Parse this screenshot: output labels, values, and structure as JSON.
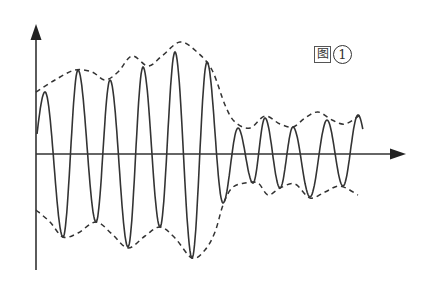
{
  "figure": {
    "label_char": "图",
    "label_number": "1",
    "label_full": "图①",
    "colors": {
      "background": "#ffffff",
      "wave": "#333333",
      "envelope": "#333333",
      "axis": "#333333"
    },
    "axes": {
      "origin": [
        36,
        154
      ],
      "y_axis_top": 25,
      "y_axis_bottom": 270,
      "x_axis_end": 405
    },
    "waveform": {
      "description": "Oscillating signal with varying amplitude: large-amplitude section followed by smaller-amplitude section",
      "peaks": [
        [
          45,
          92
        ],
        [
          78,
          70
        ],
        [
          110,
          80
        ],
        [
          143,
          67
        ],
        [
          175,
          52
        ],
        [
          207,
          62
        ],
        [
          238,
          128
        ],
        [
          265,
          118
        ],
        [
          293,
          127
        ],
        [
          327,
          120
        ],
        [
          358,
          115
        ]
      ],
      "troughs": [
        [
          63,
          237
        ],
        [
          96,
          222
        ],
        [
          128,
          247
        ],
        [
          160,
          227
        ],
        [
          192,
          258
        ],
        [
          223,
          203
        ],
        [
          253,
          183
        ],
        [
          280,
          188
        ],
        [
          310,
          197
        ],
        [
          343,
          186
        ]
      ]
    },
    "upper_envelope": [
      [
        36,
        92
      ],
      [
        55,
        80
      ],
      [
        75,
        70
      ],
      [
        92,
        72
      ],
      [
        105,
        80
      ],
      [
        118,
        72
      ],
      [
        132,
        56
      ],
      [
        148,
        66
      ],
      [
        162,
        56
      ],
      [
        180,
        42
      ],
      [
        197,
        52
      ],
      [
        212,
        70
      ],
      [
        225,
        105
      ],
      [
        235,
        122
      ],
      [
        250,
        128
      ],
      [
        265,
        116
      ],
      [
        280,
        124
      ],
      [
        293,
        127
      ],
      [
        305,
        118
      ],
      [
        318,
        112
      ],
      [
        332,
        120
      ],
      [
        345,
        124
      ],
      [
        360,
        115
      ]
    ],
    "lower_envelope": [
      [
        36,
        210
      ],
      [
        50,
        222
      ],
      [
        63,
        237
      ],
      [
        78,
        233
      ],
      [
        96,
        222
      ],
      [
        112,
        234
      ],
      [
        128,
        248
      ],
      [
        145,
        236
      ],
      [
        160,
        227
      ],
      [
        175,
        238
      ],
      [
        192,
        258
      ],
      [
        205,
        250
      ],
      [
        215,
        232
      ],
      [
        223,
        205
      ],
      [
        232,
        188
      ],
      [
        245,
        183
      ],
      [
        258,
        183
      ],
      [
        268,
        195
      ],
      [
        280,
        188
      ],
      [
        295,
        184
      ],
      [
        310,
        198
      ],
      [
        325,
        192
      ],
      [
        340,
        186
      ],
      [
        358,
        195
      ]
    ]
  }
}
